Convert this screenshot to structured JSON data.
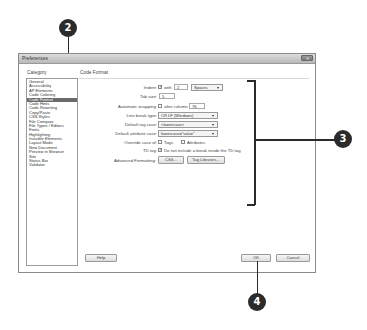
{
  "dialog": {
    "title": "Preferences",
    "close_label": "✕",
    "category_label": "Category",
    "section_title": "Code Format"
  },
  "categories": [
    {
      "label": "General"
    },
    {
      "label": "Accessibility"
    },
    {
      "label": "AP Elements"
    },
    {
      "label": "Code Coloring"
    },
    {
      "label": "Code Format",
      "selected": true
    },
    {
      "label": "Code Hints"
    },
    {
      "label": "Code Rewriting"
    },
    {
      "label": "Copy/Paste"
    },
    {
      "label": "CSS Styles"
    },
    {
      "label": "File Compare"
    },
    {
      "label": "File Types / Editors"
    },
    {
      "label": "Fonts"
    },
    {
      "label": "Highlighting"
    },
    {
      "label": "Invisible Elements"
    },
    {
      "label": "Layout Mode"
    },
    {
      "label": "New Document"
    },
    {
      "label": "Preview in Browser"
    },
    {
      "label": "Site"
    },
    {
      "label": "Status Bar"
    },
    {
      "label": "Validator"
    }
  ],
  "form": {
    "indent": {
      "label": "Indent:",
      "checked": true,
      "with_label": "with",
      "value": "2",
      "unit": "Spaces"
    },
    "tab_size": {
      "label": "Tab size:",
      "value": "5"
    },
    "wrapping": {
      "label": "Automatic wrapping:",
      "checked": false,
      "after_label": "after column",
      "value": "76"
    },
    "line_break": {
      "label": "Line break type:",
      "value": "CR LF (Windows)"
    },
    "tag_case": {
      "label": "Default tag case:",
      "value": "<lowercase>"
    },
    "attr_case": {
      "label": "Default attribute case:",
      "value": "lowercase=\"value\""
    },
    "override": {
      "label": "Override case of:",
      "tags_label": "Tags",
      "tags_checked": false,
      "attrs_label": "Attributes",
      "attrs_checked": false
    },
    "td_tag": {
      "label": "TD tag:",
      "checked": true,
      "text": "Do not include a break inside the TD tag"
    },
    "advanced": {
      "label": "Advanced Formatting:",
      "css_button": "CSS...",
      "tag_lib_button": "Tag Libraries..."
    }
  },
  "footer": {
    "help": "Help",
    "ok": "OK",
    "cancel": "Cancel"
  },
  "callouts": {
    "c2": "2",
    "c3": "3",
    "c4": "4"
  },
  "check_glyph": "✓"
}
